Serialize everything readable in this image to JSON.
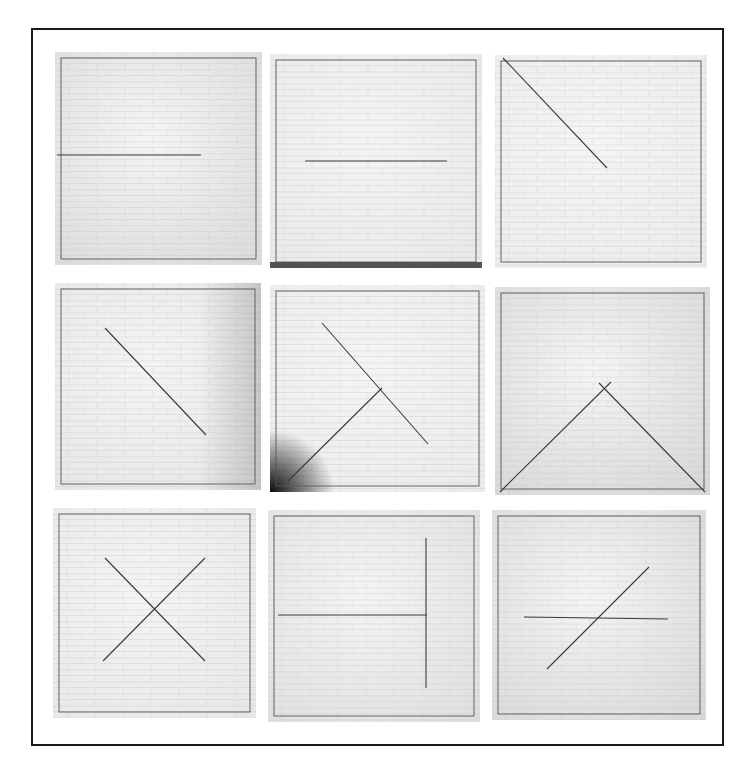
{
  "figure": {
    "rows": 3,
    "columns": 3,
    "frame_color": "#1a1a1a",
    "wall_color": "#e4e4e4",
    "line_color": "#3a3a3a"
  },
  "panels": [
    {
      "id": 1,
      "x": 55,
      "y": 52,
      "w": 207,
      "h": 213,
      "bg": "#dcdcdc",
      "content": "horizontal line from left edge to center",
      "lines": [
        [
          2,
          103,
          146,
          103
        ]
      ],
      "shadow": null
    },
    {
      "id": 2,
      "x": 270,
      "y": 54,
      "w": 212,
      "h": 214,
      "bg": "#e9e9e9",
      "content": "horizontal line centered",
      "lines": [
        [
          35,
          107,
          177,
          107
        ]
      ],
      "shadow": "bottom"
    },
    {
      "id": 3,
      "x": 495,
      "y": 55,
      "w": 212,
      "h": 213,
      "bg": "#ececec",
      "content": "diagonal from top-left corner to center",
      "lines": [
        [
          8,
          3,
          112,
          113
        ]
      ],
      "shadow": null
    },
    {
      "id": 4,
      "x": 55,
      "y": 283,
      "w": 206,
      "h": 207,
      "bg": "#e6e6e6",
      "content": "diagonal line through center",
      "lines": [
        [
          50,
          45,
          151,
          152
        ]
      ],
      "shadow": "right"
    },
    {
      "id": 5,
      "x": 270,
      "y": 285,
      "w": 215,
      "h": 207,
      "bg": "#ebebeb",
      "content": "two diagonals forming offset cross",
      "lines": [
        [
          52,
          38,
          158,
          159
        ],
        [
          112,
          103,
          18,
          196
        ]
      ],
      "shadow": "bottom-left"
    },
    {
      "id": 6,
      "x": 495,
      "y": 287,
      "w": 215,
      "h": 208,
      "bg": "#d8d8d8",
      "content": "inverted V from bottom corners meeting above center",
      "lines": [
        [
          5,
          205,
          116,
          95
        ],
        [
          104,
          96,
          210,
          205
        ]
      ],
      "shadow": null
    },
    {
      "id": 7,
      "x": 53,
      "y": 508,
      "w": 203,
      "h": 210,
      "bg": "#e8e8e8",
      "content": "X cross centered",
      "lines": [
        [
          52,
          50,
          152,
          153
        ],
        [
          152,
          50,
          50,
          153
        ]
      ],
      "shadow": null
    },
    {
      "id": 8,
      "x": 268,
      "y": 510,
      "w": 212,
      "h": 212,
      "bg": "#e0e0e0",
      "content": "horizontal line from left edge and vertical line on right forming T",
      "lines": [
        [
          10,
          105,
          159,
          105
        ],
        [
          158,
          28,
          158,
          178
        ]
      ],
      "shadow": null
    },
    {
      "id": 9,
      "x": 492,
      "y": 510,
      "w": 214,
      "h": 210,
      "bg": "#dadada",
      "content": "horizontal line crossed by diagonal",
      "lines": [
        [
          32,
          107,
          176,
          109
        ],
        [
          55,
          159,
          157,
          57
        ]
      ],
      "shadow": null
    }
  ]
}
